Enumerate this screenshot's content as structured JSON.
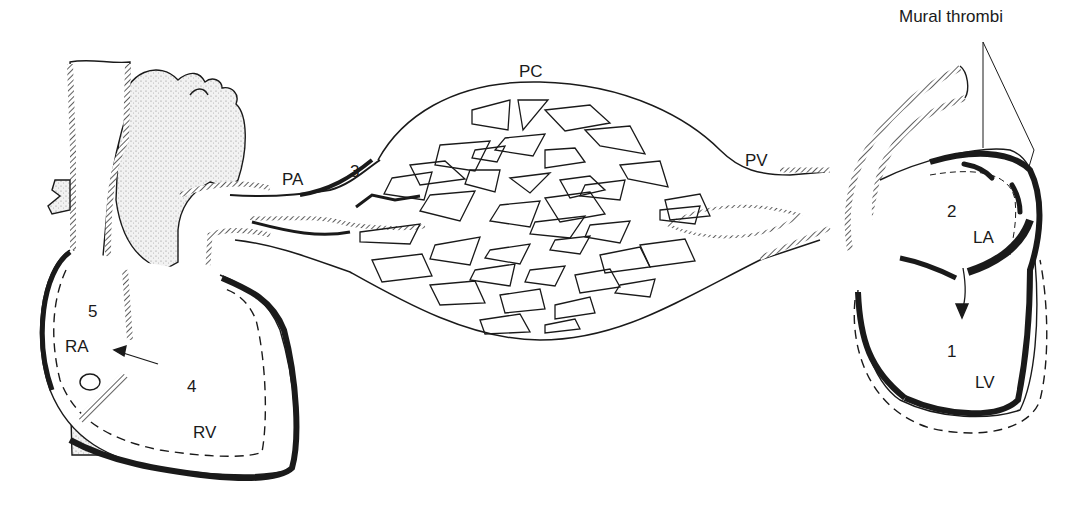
{
  "figure": {
    "type": "anatomical-diagram"
  },
  "labels": {
    "mural_thrombi": "Mural thrombi",
    "pc": "PC",
    "pa": "PA",
    "pv": "PV",
    "n3": "3",
    "n5": "5",
    "ra": "RA",
    "n4": "4",
    "rv": "RV",
    "n2": "2",
    "la": "LA",
    "n1": "1",
    "lv": "LV"
  },
  "colors": {
    "ink": "#1a1a1a",
    "stipple": "#d8d8d8",
    "background": "#ffffff"
  }
}
